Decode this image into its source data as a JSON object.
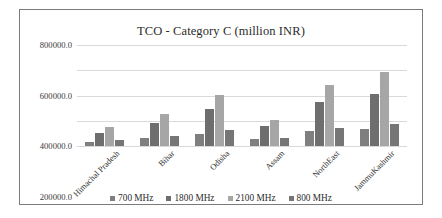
{
  "chart_data": {
    "type": "bar",
    "title": "TCO - Category C (million INR)",
    "xlabel": "",
    "ylabel": "",
    "ylim": [
      0,
      800000
    ],
    "ytick_labels": [
      "800000.0",
      "600000.0",
      "400000.0",
      "200000.0",
      "0.0"
    ],
    "yticks": [
      800000,
      600000,
      400000,
      200000,
      0
    ],
    "grid": true,
    "legend_position": "bottom",
    "categories": [
      "Himachal Pradesh",
      "Bihar",
      "Odisha",
      "Assam",
      "NorthEast",
      "JammuKashmir"
    ],
    "series": [
      {
        "name": "700 MHz",
        "color": "#7f7f7f",
        "values": [
          35000,
          65000,
          98000,
          53000,
          115000,
          138000
        ]
      },
      {
        "name": "1800 MHz",
        "color": "#6e6e6e",
        "values": [
          105000,
          180000,
          290000,
          155000,
          345000,
          415000
        ]
      },
      {
        "name": "2100 MHz",
        "color": "#a6a6a6",
        "values": [
          150000,
          255000,
          405000,
          210000,
          485000,
          590000
        ]
      },
      {
        "name": "800 MHz",
        "color": "#767676",
        "values": [
          45000,
          78000,
          125000,
          65000,
          145000,
          175000
        ]
      }
    ]
  },
  "colors": {
    "frame_border": "#7b7b7b",
    "gridline": "#d9d9d9",
    "text": "#2b2b2b",
    "background": "#ffffff"
  }
}
